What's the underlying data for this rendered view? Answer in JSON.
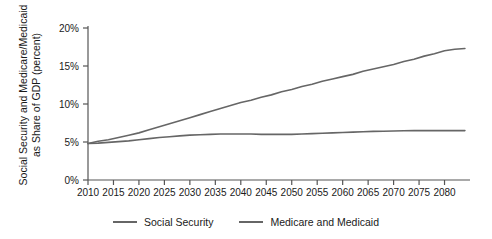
{
  "chart_data": {
    "type": "line",
    "title": "",
    "xlabel": "",
    "ylabel": "Social Security and Medicare/Medicaid as Share of GDP (percent)",
    "ylabel_line1": "Social Security and Medicare/Medicaid",
    "ylabel_line2": "as Share of GDP (percent)",
    "xlim": [
      2010,
      2085
    ],
    "ylim": [
      0,
      20
    ],
    "grid": false,
    "legend_position": "bottom-center",
    "xticks": [
      2010,
      2015,
      2020,
      2025,
      2030,
      2035,
      2040,
      2045,
      2050,
      2055,
      2060,
      2065,
      2070,
      2075,
      2080
    ],
    "xticklabels": [
      "2010",
      "2015",
      "2020",
      "2025",
      "2030",
      "2035",
      "2040",
      "2045",
      "2050",
      "2055",
      "2060",
      "2065",
      "2070",
      "2075",
      "2080"
    ],
    "yticks": [
      0,
      5,
      10,
      15,
      20
    ],
    "yticklabels": [
      "0%",
      "5%",
      "10%",
      "15%",
      "20%"
    ],
    "x": [
      2010,
      2012,
      2014,
      2016,
      2018,
      2020,
      2022,
      2024,
      2026,
      2028,
      2030,
      2032,
      2034,
      2036,
      2038,
      2040,
      2042,
      2044,
      2046,
      2048,
      2050,
      2052,
      2054,
      2056,
      2058,
      2060,
      2062,
      2064,
      2066,
      2068,
      2070,
      2072,
      2074,
      2076,
      2078,
      2080,
      2082,
      2084
    ],
    "series": [
      {
        "name": "Social Security",
        "color": "#666666",
        "values": [
          4.8,
          4.85,
          4.95,
          5.05,
          5.15,
          5.3,
          5.45,
          5.6,
          5.7,
          5.8,
          5.9,
          5.95,
          6.0,
          6.05,
          6.05,
          6.05,
          6.05,
          6.0,
          6.0,
          6.0,
          6.0,
          6.05,
          6.1,
          6.15,
          6.2,
          6.25,
          6.3,
          6.35,
          6.4,
          6.42,
          6.45,
          6.48,
          6.5,
          6.5,
          6.5,
          6.5,
          6.5,
          6.5
        ]
      },
      {
        "name": "Medicare and Medicaid",
        "color": "#666666",
        "values": [
          4.8,
          5.1,
          5.3,
          5.6,
          5.9,
          6.2,
          6.6,
          7.0,
          7.4,
          7.8,
          8.2,
          8.6,
          9.0,
          9.4,
          9.8,
          10.2,
          10.5,
          10.9,
          11.2,
          11.6,
          11.9,
          12.3,
          12.6,
          13.0,
          13.3,
          13.6,
          13.9,
          14.3,
          14.6,
          14.9,
          15.2,
          15.6,
          15.9,
          16.3,
          16.6,
          17.0,
          17.2,
          17.3
        ]
      }
    ]
  },
  "legend": {
    "items": [
      {
        "label": "Social Security",
        "color": "#666666"
      },
      {
        "label": "Medicare and Medicaid",
        "color": "#666666"
      }
    ]
  },
  "colors": {
    "axis": "#555555",
    "line": "#666666",
    "text": "#1a1a1a",
    "background": "#ffffff"
  }
}
